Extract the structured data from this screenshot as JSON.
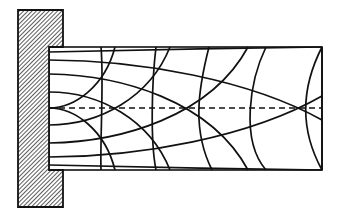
{
  "diagram": {
    "title": "Stress trajectories in a cantilever beam",
    "colors": {
      "ink": "#111111",
      "background": "#ffffff",
      "hatch": "#555555"
    },
    "wall": {
      "x": 18,
      "y": 10,
      "width": 45,
      "height": 197,
      "label": "fixed support"
    },
    "beam": {
      "x": 49,
      "y": 47,
      "right": 322,
      "bottom": 170
    },
    "neutral_axis": {
      "y": 108,
      "style": "dashed"
    },
    "compression_trajectories": [
      "M49 52 C120 50 240 48 322 47",
      "M49 60 C140 60 250 80 322 120",
      "M49 74 C120 75 210 100 248 170",
      "M49 92 C100 92 150 120 170 170",
      "M49 108 C75 108 105 130 115 170"
    ],
    "tension_trajectories": [
      "M49 165 C120 167 240 169 322 170",
      "M49 157 C140 157 250 137 322 96",
      "M49 143 C120 142 210 117 248 47",
      "M49 125 C100 125 150 97 170 47",
      "M49 108 C75 108 105 86 115 47"
    ],
    "cross_arcs": [
      "M101 47 C104 80 100 140 101 170",
      "M156 47 C152 80 150 140 156 170",
      "M209 47 C198 90 192 130 212 170",
      "M266 47 C250 80 240 140 266 170",
      "M322 47 C300 90 300 130 322 170"
    ]
  }
}
